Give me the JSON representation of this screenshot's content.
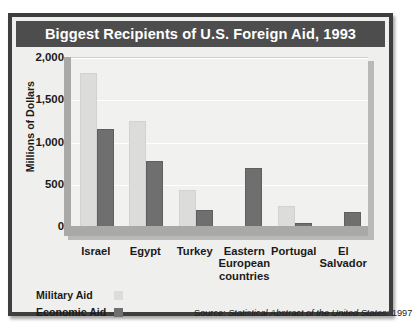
{
  "figure": {
    "title": "Biggest Recipients of U.S. Foreign Aid, 1993",
    "source_label": "Source:",
    "source_title": "Statistical Abstract of the United States",
    "source_year": ": 1997"
  },
  "legend": {
    "items": [
      {
        "label": "Military Aid",
        "color": "#dcdcda"
      },
      {
        "label": "Economic Aid",
        "color": "#6f6f6f"
      }
    ]
  },
  "colors": {
    "title_bar": "#4d4d4d",
    "frame": "#3e3e3e",
    "plot_background": "#f1f1ef",
    "military": "#dcdcda",
    "economic": "#6f6f6f",
    "gridline": "#ffffff"
  },
  "chart_data": {
    "type": "bar",
    "title": "Biggest Recipients of U.S. Foreign Aid, 1993",
    "xlabel": "",
    "ylabel": "Millions of Dollars",
    "categories": [
      "Israel",
      "Egypt",
      "Turkey",
      "Eastern European countries",
      "Portugal",
      "El Salvador"
    ],
    "category_lines": [
      [
        "Israel"
      ],
      [
        "Egypt"
      ],
      [
        "Turkey"
      ],
      [
        "Eastern",
        "European",
        "countries"
      ],
      [
        "Portugal"
      ],
      [
        "El",
        "Salvador"
      ]
    ],
    "series": [
      {
        "name": "Military Aid",
        "values": [
          1800,
          1230,
          420,
          0,
          230,
          0
        ]
      },
      {
        "name": "Economic Aid",
        "values": [
          1140,
          760,
          180,
          680,
          20,
          150
        ]
      }
    ],
    "ylim": [
      0,
      2000
    ],
    "yticks": [
      0,
      500,
      1000,
      1500,
      2000
    ],
    "ytick_labels": [
      "0",
      "500",
      "1,000",
      "1,500",
      "2,000"
    ],
    "grid": true,
    "legend_position": "bottom-left"
  }
}
